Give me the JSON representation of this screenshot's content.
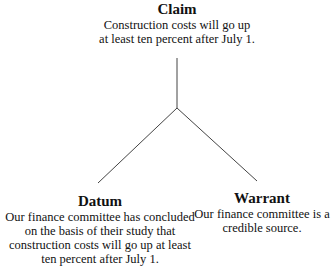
{
  "diagram": {
    "type": "toulmin-argument-model",
    "nodes": {
      "claim": {
        "title": "Claim",
        "body": "Construction costs will go up\nat least ten percent after July 1."
      },
      "datum": {
        "title": "Datum",
        "body": "Our finance committee has concluded\non the basis of their study that\nconstruction costs will go up at least\nten percent after July 1."
      },
      "warrant": {
        "title": "Warrant",
        "body": "Our finance committee is a\ncredible source."
      }
    },
    "edges": [
      {
        "from": "junction",
        "to": "claim"
      },
      {
        "from": "junction",
        "to": "datum"
      },
      {
        "from": "junction",
        "to": "warrant"
      }
    ],
    "line_color": "#444444"
  }
}
